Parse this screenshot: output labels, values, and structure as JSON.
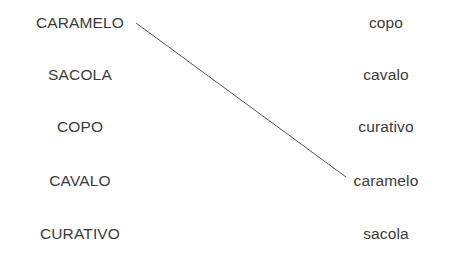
{
  "exercise": {
    "background_color": "#ffffff",
    "text_color": "#3a3a3a",
    "line_color": "#555555",
    "left_column": {
      "items": [
        {
          "label": "CARAMELO"
        },
        {
          "label": "SACOLA"
        },
        {
          "label": "COPO"
        },
        {
          "label": "CAVALO"
        },
        {
          "label": "CURATIVO"
        }
      ]
    },
    "right_column": {
      "items": [
        {
          "label": "copo"
        },
        {
          "label": "cavalo"
        },
        {
          "label": "curativo"
        },
        {
          "label": "caramelo"
        },
        {
          "label": "sacola"
        }
      ]
    },
    "connections": [
      {
        "from_label": "CARAMELO",
        "to_label": "caramelo",
        "x1": 136,
        "y1": 23,
        "x2": 346,
        "y2": 177
      }
    ]
  }
}
